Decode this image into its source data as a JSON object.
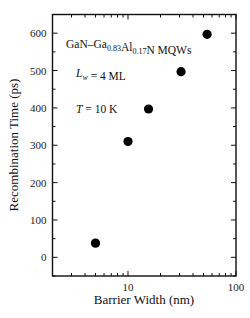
{
  "chart_data": {
    "type": "scatter",
    "title": "",
    "xlabel": "Barrier Width (nm)",
    "ylabel": "Recombination Time (ps)",
    "xscale": "log",
    "xlim": [
      2,
      100
    ],
    "ylim": [
      -50,
      650
    ],
    "x_tick_labels": [
      "10",
      "100"
    ],
    "x_ticks": [
      10,
      100
    ],
    "y_tick_labels": [
      "0",
      "100",
      "200",
      "300",
      "400",
      "500",
      "600"
    ],
    "y_ticks": [
      0,
      100,
      200,
      300,
      400,
      500,
      600
    ],
    "grid": false,
    "legend": null,
    "annotations": [
      {
        "parts": [
          [
            "GaN–Ga",
            ""
          ],
          [
            "0.83",
            "sub"
          ],
          [
            "Al",
            ""
          ],
          [
            "0.17",
            "sub"
          ],
          [
            "N MQWs",
            ""
          ]
        ]
      },
      {
        "parts": [
          [
            "L",
            "italic"
          ],
          [
            "w",
            "sub-italic"
          ],
          [
            " = 4 ML",
            ""
          ]
        ]
      },
      {
        "parts": [
          [
            "T",
            "italic"
          ],
          [
            " = 10 K",
            ""
          ]
        ]
      }
    ],
    "series": [
      {
        "name": "GaN–Ga0.83Al0.17N MQWs",
        "marker": "filled-circle",
        "color": "#000000",
        "x": [
          5,
          10,
          15.5,
          31,
          54
        ],
        "y": [
          38,
          310,
          397,
          497,
          597
        ]
      }
    ]
  }
}
